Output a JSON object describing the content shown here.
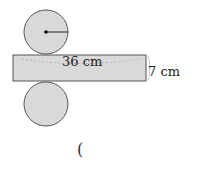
{
  "figure": {
    "type": "cylinder-net",
    "rectangle": {
      "length_label": "36 cm",
      "height_label": "7 cm"
    },
    "top_circle": {
      "radius_marked": true
    },
    "bottom_circle": {
      "radius_marked": false
    }
  },
  "answer": {
    "open_paren": "("
  },
  "colors": {
    "fill": "#d9d9d9",
    "stroke": "#555555",
    "text": "#222222"
  }
}
